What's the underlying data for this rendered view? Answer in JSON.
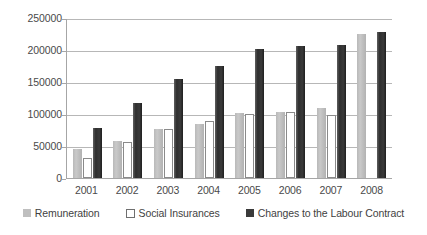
{
  "chart_data": {
    "type": "bar",
    "title": "",
    "subtitle": "",
    "xlabel": "",
    "ylabel": "",
    "categories": [
      "2001",
      "2002",
      "2003",
      "2004",
      "2005",
      "2006",
      "2007",
      "2008"
    ],
    "series": [
      {
        "name": "Remuneration",
        "color": "#bfbfbf",
        "values": [
          45000,
          58000,
          76000,
          85000,
          101000,
          103000,
          110000,
          225000
        ]
      },
      {
        "name": "Social Insurances",
        "color": "#ffffff",
        "values": [
          31000,
          57000,
          76000,
          89000,
          100000,
          103000,
          98000,
          0
        ]
      },
      {
        "name": "Changes to the Labour Contract",
        "color": "#3a3a3a",
        "values": [
          78000,
          117000,
          155000,
          175000,
          201000,
          206000,
          208000,
          228000
        ]
      }
    ],
    "ylim": [
      0,
      250000
    ],
    "yticks": [
      0,
      50000,
      100000,
      150000,
      200000,
      250000
    ],
    "ytick_labels": [
      "0",
      "50000",
      "100000",
      "150000",
      "200000",
      "250000"
    ],
    "grid": true,
    "legend_position": "bottom"
  },
  "axis": {
    "y_tick_labels": [
      "250000",
      "200000",
      "150000",
      "100000",
      "50000",
      "0"
    ],
    "x_tick_labels": [
      "2001",
      "2002",
      "2003",
      "2004",
      "2005",
      "2006",
      "2007",
      "2008"
    ]
  },
  "legend": {
    "items": [
      {
        "label": "Remuneration",
        "swatch": "filled-gray-square-icon"
      },
      {
        "label": "Social Insurances",
        "swatch": "outlined-white-square-icon"
      },
      {
        "label": "Changes to the Labour Contract",
        "swatch": "filled-dark-square-icon"
      }
    ]
  },
  "colors": {
    "series_remuneration": "#bfbfbf",
    "series_social_insurances": "#ffffff",
    "series_changes": "#3a3a3a",
    "gridline": "#b7b7b7",
    "axis": "#a6a6a6",
    "text": "#444444"
  }
}
